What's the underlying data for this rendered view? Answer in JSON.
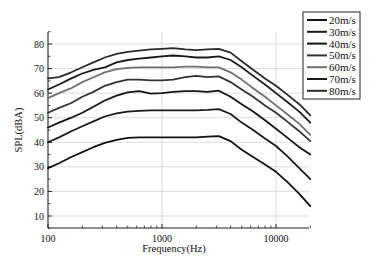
{
  "chart_data": {
    "type": "line",
    "title": "",
    "xlabel": "Frequency(Hz)",
    "ylabel": "SPL(dBA)",
    "xscale": "log",
    "xlim": [
      100,
      20000
    ],
    "ylim": [
      5,
      85
    ],
    "xticks": [
      100,
      1000,
      10000
    ],
    "xtick_labels": [
      "100",
      "1000",
      "10000"
    ],
    "yticks": [
      10,
      20,
      30,
      40,
      50,
      60,
      70,
      80
    ],
    "ytick_labels": [
      "10",
      "20",
      "30",
      "40",
      "50",
      "60",
      "70",
      "80"
    ],
    "grid": true,
    "legend_position": "upper right, outside plot top",
    "x": [
      100,
      125,
      160,
      200,
      250,
      315,
      400,
      500,
      630,
      800,
      1000,
      1250,
      1600,
      2000,
      2500,
      3150,
      4000,
      5000,
      6300,
      8000,
      10000,
      12500,
      16000,
      20000
    ],
    "series": [
      {
        "name": "20m/s",
        "color": "#111111",
        "values": [
          29.5,
          31.5,
          34,
          36,
          38,
          39.8,
          41,
          41.8,
          42,
          42,
          42,
          42,
          42,
          42,
          42.3,
          42.5,
          40.5,
          37,
          34,
          31,
          28,
          24,
          19,
          14
        ]
      },
      {
        "name": "30m/s",
        "color": "#1a1a1a",
        "values": [
          40,
          42,
          44.5,
          46.5,
          48.5,
          50.5,
          51.8,
          52.5,
          52.8,
          53,
          53,
          53,
          53,
          53,
          53.2,
          53.5,
          51.5,
          48,
          45,
          41.5,
          38.5,
          34.5,
          29.5,
          25
        ]
      },
      {
        "name": "40m/s",
        "color": "#151515",
        "values": [
          46,
          48,
          50,
          52,
          54.5,
          57,
          59,
          60.3,
          60.8,
          59.8,
          60,
          60.5,
          60.8,
          60.8,
          60.5,
          61,
          58.5,
          55.5,
          52.5,
          49,
          45.5,
          42,
          38,
          35
        ]
      },
      {
        "name": "50m/s",
        "color": "#333333",
        "values": [
          52,
          54,
          56,
          58.5,
          60.5,
          63,
          64.5,
          65.5,
          65.5,
          65.2,
          65.2,
          65.5,
          66.5,
          67,
          66.5,
          66.8,
          64.5,
          61.5,
          58.5,
          55,
          52,
          48.5,
          44.5,
          40.5
        ]
      },
      {
        "name": "60m/s",
        "color": "#707070",
        "values": [
          58,
          60,
          62,
          64.5,
          66.5,
          68.5,
          69.8,
          70.3,
          70.5,
          70.5,
          70.5,
          70.5,
          70.8,
          70.8,
          70.5,
          70.5,
          68.5,
          65.5,
          62,
          58.5,
          55,
          51.5,
          47.5,
          43
        ]
      },
      {
        "name": "70m/s",
        "color": "#1a1a1a",
        "values": [
          61.5,
          63.5,
          66,
          68,
          69.5,
          70.5,
          72.5,
          73.5,
          74,
          74.5,
          75,
          75.3,
          75,
          74.5,
          74.5,
          75,
          73.5,
          70.5,
          67,
          63.5,
          60,
          56.5,
          52.5,
          48
        ]
      },
      {
        "name": "80m/s",
        "color": "#2a2a2a",
        "values": [
          66,
          66.5,
          68.5,
          70.5,
          72.5,
          74.5,
          76,
          76.8,
          77.3,
          77.8,
          78,
          78.3,
          77.8,
          77.5,
          77.8,
          78,
          76.5,
          73,
          69.5,
          66,
          63,
          59.5,
          55.5,
          51
        ]
      }
    ]
  }
}
